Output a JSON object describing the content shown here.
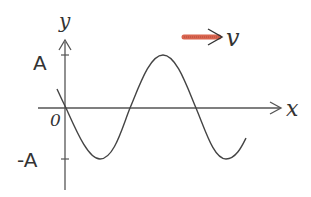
{
  "diagram": {
    "type": "transverse-wave",
    "axes": {
      "x_label": "x",
      "y_label": "y",
      "origin_label": "0",
      "amplitude_label_pos": "A",
      "amplitude_label_neg": "-A"
    },
    "velocity": {
      "label": "v",
      "direction": "right",
      "arrow_color": "#d9654f"
    },
    "curve": {
      "description": "sinusoid passing through origin going downward, minimum at -A, maximum at A",
      "color": "#444444"
    }
  }
}
